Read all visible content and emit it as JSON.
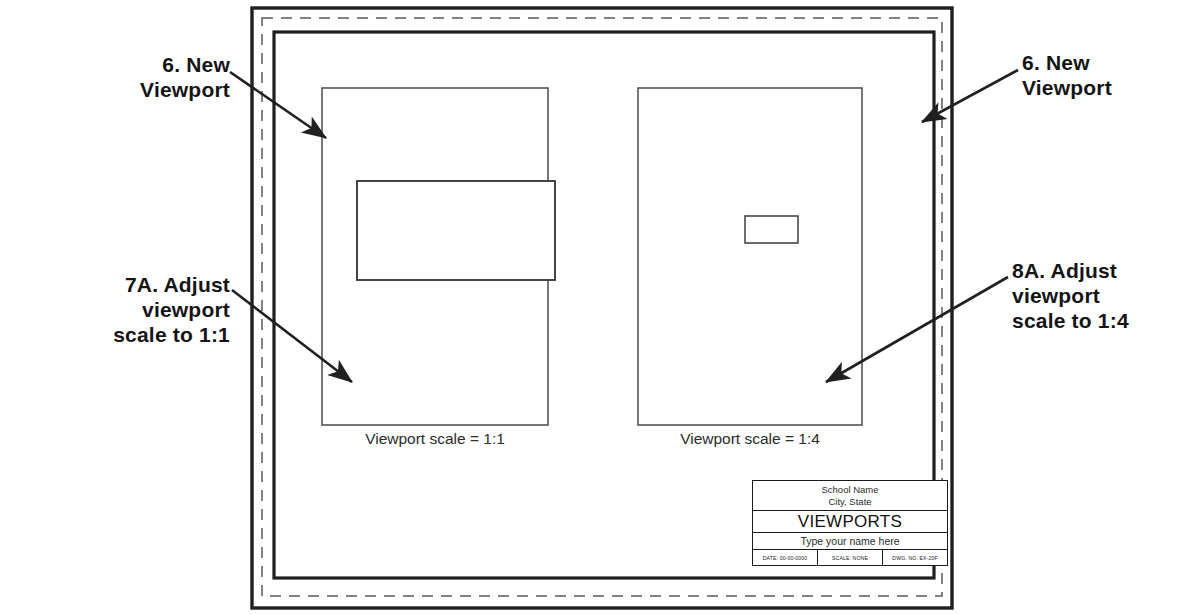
{
  "drawing": {
    "borders": {
      "paper_edge": {
        "x": 252,
        "y": 8,
        "w": 700,
        "h": 600
      },
      "printable_area_dashed": {
        "x": 262,
        "y": 18,
        "w": 680,
        "h": 578
      },
      "drawing_border": {
        "x": 274,
        "y": 32,
        "w": 660,
        "h": 546
      }
    },
    "viewports": [
      {
        "name": "left-viewport",
        "frame": {
          "x": 322,
          "y": 88,
          "w": 226,
          "h": 337
        },
        "caption": "Viewport scale = 1:1",
        "scale": "1:1",
        "content_rect": {
          "x": 357,
          "y": 181,
          "w": 198,
          "h": 99
        }
      },
      {
        "name": "right-viewport",
        "frame": {
          "x": 638,
          "y": 88,
          "w": 224,
          "h": 337
        },
        "caption": "Viewport scale = 1:4",
        "scale": "1:4",
        "content_rect": {
          "x": 745,
          "y": 216,
          "w": 53,
          "h": 27
        }
      }
    ]
  },
  "callouts": [
    {
      "id": "new-viewport-left",
      "text": "6.  New\nViewport",
      "align": "right",
      "leader": {
        "from": [
          230,
          72
        ],
        "to": [
          326,
          138
        ]
      }
    },
    {
      "id": "adjust-left",
      "text": "7A. Adjust\nviewport\nscale to 1:1",
      "align": "right",
      "leader": {
        "from": [
          232,
          290
        ],
        "to": [
          352,
          382
        ]
      }
    },
    {
      "id": "new-viewport-right",
      "text": "6.  New\nViewport",
      "align": "left",
      "leader": {
        "from": [
          1018,
          70
        ],
        "to": [
          922,
          122
        ]
      }
    },
    {
      "id": "adjust-right",
      "text": "8A. Adjust\nviewport\nscale to 1:4",
      "align": "left",
      "leader": {
        "from": [
          1008,
          277
        ],
        "to": [
          826,
          382
        ]
      }
    }
  ],
  "title_block": {
    "organization_line1": "School Name",
    "organization_line2": "City, State",
    "drawing_title": "VIEWPORTS",
    "name_prompt": "Type your name here",
    "meta": [
      "DATE: 00-00-0000",
      "SCALE: NONE",
      "DWG. NO. EX-20F"
    ]
  },
  "colors": {
    "ink": "#1a1a1a",
    "line": "#3a3a3a",
    "paper": "#ffffff"
  }
}
